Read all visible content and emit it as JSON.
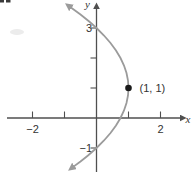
{
  "figure": {
    "xlabel": "x",
    "ylabel": "y"
  },
  "chart_data": {
    "type": "line",
    "title": "",
    "xlabel": "x",
    "ylabel": "y",
    "xlim": [
      -2.8,
      2.95
    ],
    "ylim": [
      -1.97,
      3.9
    ],
    "grid": false,
    "legend": false,
    "ticks": {
      "x": [
        {
          "v": -2,
          "label": "−2"
        },
        {
          "v": -1,
          "label": ""
        },
        {
          "v": 1,
          "label": ""
        },
        {
          "v": 2,
          "label": "2"
        }
      ],
      "y": [
        {
          "v": 3,
          "label": "3"
        },
        {
          "v": 2,
          "label": ""
        },
        {
          "v": 1,
          "label": ""
        },
        {
          "v": -1,
          "label": "−1"
        }
      ]
    },
    "series": [
      {
        "name": "leftward-opening-parabola",
        "arrow_start": true,
        "arrow_end": true,
        "points": [
          [
            -0.822,
            3.7
          ],
          [
            -0.501,
            3.45
          ],
          [
            -0.21,
            3.2
          ],
          [
            0,
            3
          ],
          [
            0.234,
            2.75
          ],
          [
            0.438,
            2.5
          ],
          [
            0.609,
            2.25
          ],
          [
            0.75,
            2
          ],
          [
            0.859,
            1.75
          ],
          [
            0.938,
            1.5
          ],
          [
            0.984,
            1.25
          ],
          [
            1,
            1
          ],
          [
            0.984,
            0.75
          ],
          [
            0.938,
            0.5
          ],
          [
            0.859,
            0.25
          ],
          [
            0.75,
            0
          ],
          [
            0.609,
            -0.25
          ],
          [
            0.438,
            -0.5
          ],
          [
            0.234,
            -0.75
          ],
          [
            0,
            -1
          ],
          [
            -0.266,
            -1.25
          ],
          [
            -0.501,
            -1.45
          ],
          [
            -0.729,
            -1.63
          ]
        ]
      }
    ],
    "marked_points": [
      {
        "x": 1,
        "y": 1,
        "label": "(1, 1)"
      }
    ]
  },
  "colors": {
    "curve": "#9b9b9b",
    "axis": "#4f4f4f",
    "text": "#333333",
    "point": "#1a1a1a"
  }
}
